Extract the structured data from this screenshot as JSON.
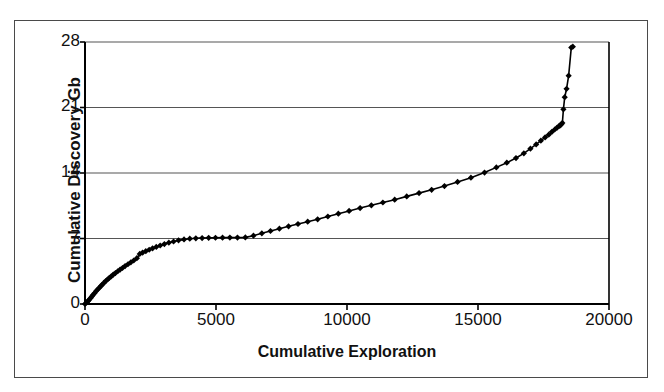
{
  "figure": {
    "background_color": "#ffffff",
    "frame_color": "#4a4a4a",
    "axis_color": "#000000",
    "gridline_color": "#555555",
    "series_color": "#000000"
  },
  "chart_data": {
    "type": "line",
    "title": "",
    "subtitle": "",
    "xlabel": "Cumulative Exploration",
    "ylabel": "Cumulative Discovery Gb",
    "xlim": [
      0,
      20000
    ],
    "ylim": [
      0,
      28
    ],
    "xticks": [
      0,
      5000,
      10000,
      15000,
      20000
    ],
    "yticks": [
      0,
      7,
      14,
      21,
      28
    ],
    "xticklabels": [
      "0",
      "5000",
      "10000",
      "15000",
      "20000"
    ],
    "yticklabels": [
      "0",
      "7",
      "14",
      "21",
      "28"
    ],
    "grid": "horizontal",
    "legend": "none",
    "marker": "diamond",
    "series": [
      {
        "name": "Cumulative Discovery",
        "x": [
          0,
          60,
          110,
          160,
          210,
          260,
          310,
          360,
          420,
          480,
          540,
          600,
          660,
          720,
          790,
          860,
          930,
          1000,
          1080,
          1160,
          1250,
          1340,
          1430,
          1530,
          1640,
          1750,
          1860,
          1980,
          2090,
          2200,
          2320,
          2450,
          2580,
          2720,
          2870,
          3030,
          3200,
          3380,
          3570,
          3780,
          4000,
          4230,
          4470,
          4720,
          4980,
          5250,
          5530,
          5820,
          6120,
          6430,
          6750,
          7080,
          7420,
          7770,
          8130,
          8500,
          8880,
          9270,
          9670,
          10080,
          10500,
          10930,
          11370,
          11820,
          12280,
          12750,
          13230,
          13720,
          14220,
          14730,
          15250,
          15700,
          16100,
          16450,
          16750,
          17000,
          17220,
          17400,
          17560,
          17700,
          17820,
          17930,
          18020,
          18090,
          18140,
          18180,
          18220,
          18260,
          18310,
          18380,
          18460,
          18560,
          18620
        ],
        "y": [
          0.0,
          0.15,
          0.3,
          0.45,
          0.62,
          0.8,
          0.98,
          1.15,
          1.35,
          1.55,
          1.72,
          1.9,
          2.08,
          2.25,
          2.45,
          2.62,
          2.8,
          2.95,
          3.15,
          3.3,
          3.5,
          3.68,
          3.85,
          4.05,
          4.25,
          4.45,
          4.65,
          4.9,
          5.35,
          5.5,
          5.65,
          5.8,
          5.95,
          6.1,
          6.25,
          6.4,
          6.55,
          6.68,
          6.8,
          6.9,
          6.98,
          7.02,
          7.05,
          7.07,
          7.08,
          7.09,
          7.1,
          7.1,
          7.12,
          7.3,
          7.55,
          7.8,
          8.05,
          8.3,
          8.55,
          8.8,
          9.05,
          9.35,
          9.65,
          9.95,
          10.25,
          10.55,
          10.85,
          11.15,
          11.5,
          11.85,
          12.2,
          12.6,
          13.05,
          13.5,
          14.05,
          14.6,
          15.1,
          15.6,
          16.1,
          16.6,
          17.05,
          17.45,
          17.8,
          18.1,
          18.4,
          18.65,
          18.85,
          19.0,
          19.1,
          19.2,
          19.35,
          20.8,
          22.1,
          23.0,
          24.4,
          27.4,
          27.5
        ]
      }
    ]
  }
}
